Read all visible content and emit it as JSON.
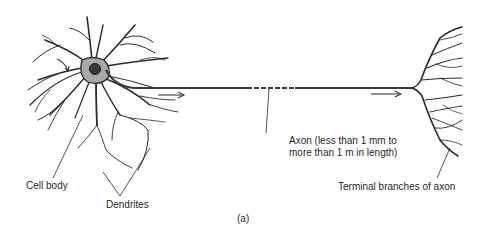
{
  "figure": {
    "caption": "(a)",
    "labels": {
      "cell_body": "Cell body",
      "dendrites": "Dendrites",
      "axon_line1": "Axon (less than 1 mm to",
      "axon_line2": "more than 1 m in length)",
      "terminal_branches": "Terminal branches of axon"
    },
    "parts": [
      "dendrites",
      "cell-body",
      "nucleus",
      "axon",
      "terminal-branches"
    ],
    "arrows": [
      {
        "name": "signal-arrow-dendrite",
        "direction": "down-right"
      },
      {
        "name": "signal-arrow-axon-1",
        "direction": "right"
      },
      {
        "name": "signal-arrow-axon-2",
        "direction": "right"
      }
    ],
    "colors": {
      "ink": "#2a2a2a",
      "cell_fill": "#a8a8a8",
      "nucleus": "#3a3a3a",
      "background": "#ffffff"
    }
  }
}
